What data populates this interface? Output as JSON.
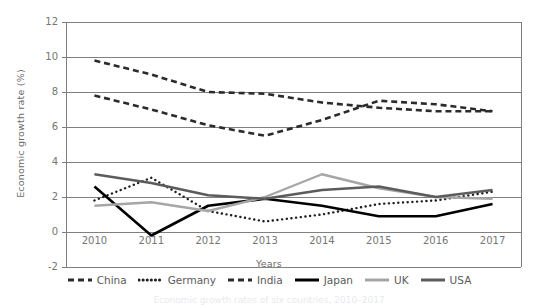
{
  "chart_data": {
    "type": "line",
    "title": "",
    "xlabel": "Years",
    "ylabel": "Economic growth rate (%)",
    "categories": [
      "2010",
      "2011",
      "2012",
      "2013",
      "2014",
      "2015",
      "2016",
      "2017"
    ],
    "x": [
      2010,
      2011,
      2012,
      2013,
      2014,
      2015,
      2016,
      2017
    ],
    "ylim": [
      -2,
      12
    ],
    "yticks": [
      "12",
      "10",
      "8",
      "6",
      "4",
      "2",
      "0",
      "-2"
    ],
    "ytick_values": [
      12,
      10,
      8,
      6,
      4,
      2,
      0,
      -2
    ],
    "grid": "horizontal",
    "legend_position": "bottom",
    "series": [
      {
        "name": "China",
        "style": "dashed",
        "color": "#2b2b2b",
        "width": 2.6,
        "values": [
          9.8,
          9.0,
          8.0,
          7.9,
          7.4,
          7.1,
          6.9,
          6.9
        ]
      },
      {
        "name": "Germany",
        "style": "dotted",
        "color": "#1f1f1f",
        "width": 2.4,
        "values": [
          1.8,
          3.1,
          1.2,
          0.6,
          1.0,
          1.6,
          1.8,
          2.3
        ]
      },
      {
        "name": "India",
        "style": "dashed",
        "color": "#2b2b2b",
        "width": 2.6,
        "values": [
          7.8,
          7.0,
          6.1,
          5.5,
          6.4,
          7.5,
          7.3,
          6.9
        ]
      },
      {
        "name": "Japan",
        "style": "solid",
        "color": "#000000",
        "width": 2.6,
        "values": [
          2.6,
          -0.2,
          1.5,
          1.9,
          1.5,
          0.9,
          0.9,
          1.6
        ]
      },
      {
        "name": "UK",
        "style": "solid",
        "color": "#a6a6a6",
        "width": 2.4,
        "values": [
          1.5,
          1.7,
          1.2,
          2.0,
          3.3,
          2.5,
          2.0,
          1.9
        ]
      },
      {
        "name": "USA",
        "style": "solid",
        "color": "#5c5c5c",
        "width": 2.6,
        "values": [
          3.3,
          2.8,
          2.1,
          1.9,
          2.4,
          2.6,
          2.0,
          2.4
        ]
      }
    ]
  },
  "axes": {
    "y_title": "Economic growth rate (%)",
    "x_title": "Years"
  },
  "legend": {
    "items": [
      {
        "label": "China",
        "style": "dashed",
        "color": "#2b2b2b"
      },
      {
        "label": "Germany",
        "style": "dotted",
        "color": "#1f1f1f"
      },
      {
        "label": "India",
        "style": "dashed",
        "color": "#2b2b2b"
      },
      {
        "label": "Japan",
        "style": "solid",
        "color": "#000000"
      },
      {
        "label": "UK",
        "style": "solid",
        "color": "#a6a6a6"
      },
      {
        "label": "USA",
        "style": "solid",
        "color": "#5c5c5c"
      }
    ]
  },
  "caption": {
    "text": "Economic growth rates of six countries, 2010–2017"
  },
  "colors": {
    "gridline": "#808080",
    "axis": "#808080",
    "text": "#757575"
  }
}
